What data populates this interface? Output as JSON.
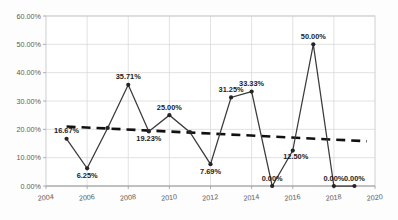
{
  "chart_data": {
    "type": "line",
    "title": "",
    "subtitle": "",
    "xlabel": "",
    "ylabel": "",
    "x": [
      2005,
      2006,
      2007,
      2008,
      2009,
      2010,
      2011,
      2012,
      2013,
      2014,
      2015,
      2016,
      2017,
      2018,
      2019
    ],
    "values": [
      16.67,
      6.25,
      20.5,
      35.71,
      19.23,
      25.0,
      19.0,
      7.69,
      31.25,
      33.33,
      0.0,
      12.5,
      50.0,
      0.0,
      0.0
    ],
    "point_labels": [
      "16.67%",
      "6.25%",
      "",
      "35.71%",
      "19.23%",
      "25.00%",
      "",
      "7.69%",
      "31.25%",
      "33.33%",
      "0.00%",
      "12.50%",
      "50.00%",
      "0.00%",
      "0.00%"
    ],
    "label_positions": [
      "above",
      "below",
      "none",
      "above",
      "below",
      "above",
      "none",
      "below",
      "above",
      "above",
      "above",
      "right",
      "above",
      "above",
      "above"
    ],
    "xlim": [
      2004,
      2020
    ],
    "ylim": [
      0,
      60
    ],
    "ytick_values": [
      0,
      10,
      20,
      30,
      40,
      50,
      60
    ],
    "ytick_labels": [
      "0.00%",
      "10.00%",
      "20.00%",
      "30.00%",
      "40.00%",
      "50.00%",
      "60.00%"
    ],
    "xtick_values": [
      2004,
      2006,
      2008,
      2010,
      2012,
      2014,
      2016,
      2018,
      2020
    ],
    "xtick_labels": [
      "2004",
      "2006",
      "2008",
      "2010",
      "2012",
      "2014",
      "2016",
      "2018",
      "2020"
    ],
    "grid": true,
    "legend": "none",
    "series": [
      {
        "name": "data-series",
        "style": "solid-line-with-markers",
        "color": "#3b3b3b",
        "values": [
          16.67,
          6.25,
          20.5,
          35.71,
          19.23,
          25.0,
          19.0,
          7.69,
          31.25,
          33.33,
          0.0,
          12.5,
          50.0,
          0.0,
          0.0
        ]
      },
      {
        "name": "linear-trendline",
        "style": "dashed",
        "color": "#111111",
        "start_value": 21.0,
        "end_value": 15.8,
        "start_x": 2005,
        "end_x": 2019.6
      }
    ]
  }
}
